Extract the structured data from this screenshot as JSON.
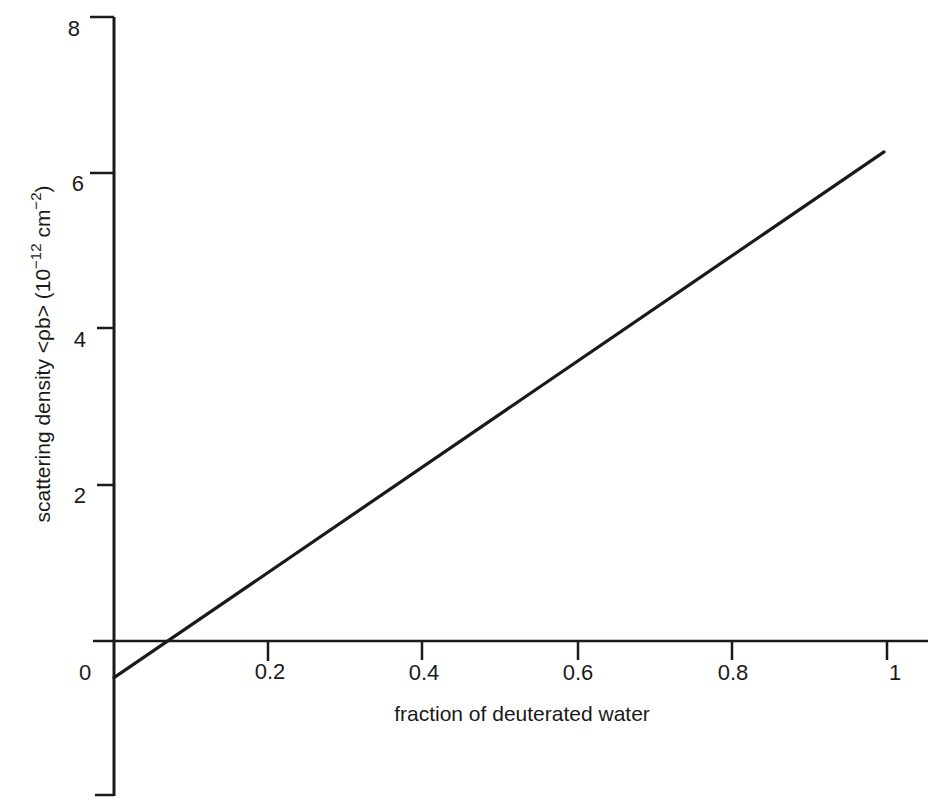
{
  "chart_data": {
    "type": "line",
    "title": "",
    "xlabel": "fraction of deuterated water",
    "ylabel": "scattering density <ρb> (10⁻¹² cm⁻²)",
    "ylabel_parts": {
      "main": "scattering density <ρb> (10",
      "exp1": "−12",
      "mid": " cm",
      "exp2": "−2",
      "end": ")"
    },
    "xlim": [
      0,
      1
    ],
    "ylim": [
      -2,
      8
    ],
    "x_ticks": [
      0,
      0.2,
      0.4,
      0.6,
      0.8,
      1
    ],
    "x_tick_labels": [
      "0",
      "0.2",
      "0.4",
      "0.6",
      "0.8",
      "1"
    ],
    "y_ticks": [
      -2,
      2,
      4,
      6,
      8
    ],
    "y_tick_labels": [
      "",
      "2",
      "4",
      "6",
      "8"
    ],
    "grid": false,
    "legend": null,
    "series": [
      {
        "name": "scattering density of H2O/D2O mixture",
        "x": [
          0,
          0.075,
          0.2,
          0.4,
          0.6,
          0.8,
          1
        ],
        "y": [
          -0.47,
          0.0,
          0.88,
          2.17,
          3.57,
          4.92,
          6.27
        ]
      }
    ],
    "annotations": [
      {
        "text": "x-intercept ≈ 0.07 (zero scattering density)",
        "x": 0.07,
        "y": 0
      }
    ]
  },
  "colors": {
    "line": "#1a1a1a",
    "axes": "#1a1a1a",
    "background": "#ffffff"
  }
}
